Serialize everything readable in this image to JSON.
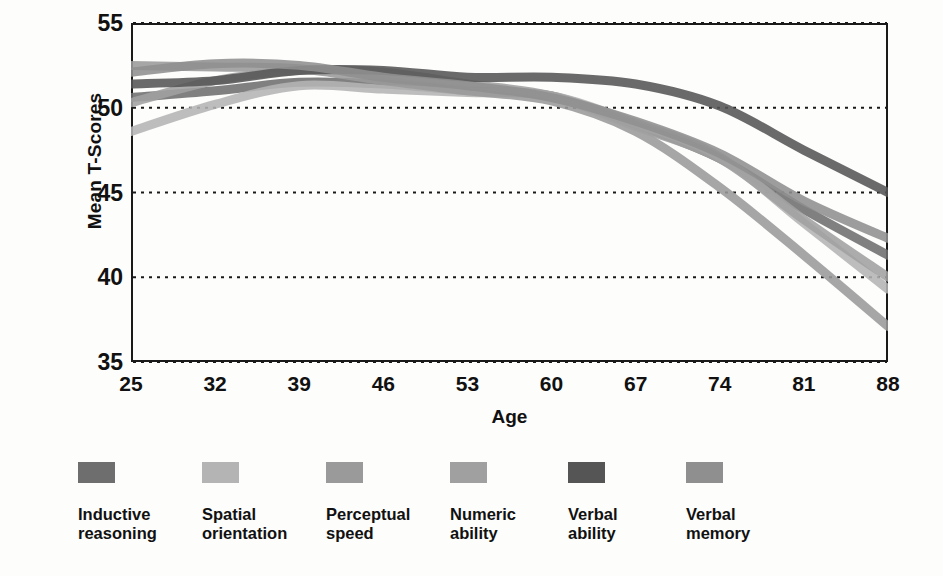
{
  "chart_data": {
    "type": "line",
    "title": "",
    "xlabel": "Age",
    "ylabel": "Mean T-Scores",
    "xlim": [
      25,
      88
    ],
    "ylim": [
      35,
      55
    ],
    "grid": true,
    "grid_style": "dotted-horizontal",
    "legend_position": "bottom",
    "x": [
      25,
      32,
      39,
      46,
      53,
      60,
      67,
      74,
      81,
      88
    ],
    "xticks": [
      "25",
      "32",
      "39",
      "46",
      "53",
      "60",
      "67",
      "74",
      "81",
      "88"
    ],
    "yticks": [
      "35",
      "40",
      "45",
      "50",
      "55"
    ],
    "series": [
      {
        "name": "Inductive reasoning",
        "color": "#6e6e6e",
        "values": [
          50.6,
          51.0,
          51.5,
          51.4,
          51.0,
          50.7,
          49.0,
          47.0,
          44.0,
          41.3
        ]
      },
      {
        "name": "Spatial orientation",
        "color": "#b4b4b4",
        "values": [
          48.6,
          50.2,
          51.3,
          51.1,
          50.9,
          50.7,
          49.1,
          47.1,
          43.2,
          39.3
        ]
      },
      {
        "name": "Perceptual speed",
        "color": "#9a9a9a",
        "values": [
          52.5,
          52.4,
          52.3,
          51.6,
          51.0,
          50.4,
          48.6,
          45.3,
          41.3,
          37.1
        ]
      },
      {
        "name": "Numeric ability",
        "color": "#a0a0a0",
        "values": [
          50.3,
          51.6,
          52.2,
          52.1,
          51.4,
          50.7,
          48.9,
          47.0,
          43.4,
          40.0
        ]
      },
      {
        "name": "Verbal ability",
        "color": "#555555",
        "values": [
          51.4,
          51.6,
          52.2,
          52.2,
          51.8,
          51.8,
          51.4,
          50.1,
          47.5,
          45.0
        ]
      },
      {
        "name": "Verbal memory",
        "color": "#8f8f8f",
        "values": [
          52.1,
          52.6,
          52.5,
          51.8,
          51.3,
          50.6,
          49.2,
          47.3,
          44.5,
          42.3
        ]
      }
    ]
  },
  "axes": {
    "y_title": "Mean T-Scores",
    "x_title": "Age",
    "y_ticks": [
      "55",
      "50",
      "45",
      "40",
      "35"
    ],
    "x_ticks": [
      "25",
      "32",
      "39",
      "46",
      "53",
      "60",
      "67",
      "74",
      "81",
      "88"
    ]
  },
  "legend": {
    "items": [
      {
        "label": "Inductive\nreasoning",
        "color": "#6e6e6e"
      },
      {
        "label": "Spatial\norientation",
        "color": "#b4b4b4"
      },
      {
        "label": "Perceptual\nspeed",
        "color": "#9a9a9a"
      },
      {
        "label": "Numeric\nability",
        "color": "#a0a0a0"
      },
      {
        "label": "Verbal\nability",
        "color": "#555555"
      },
      {
        "label": "Verbal\nmemory",
        "color": "#8f8f8f"
      }
    ]
  }
}
